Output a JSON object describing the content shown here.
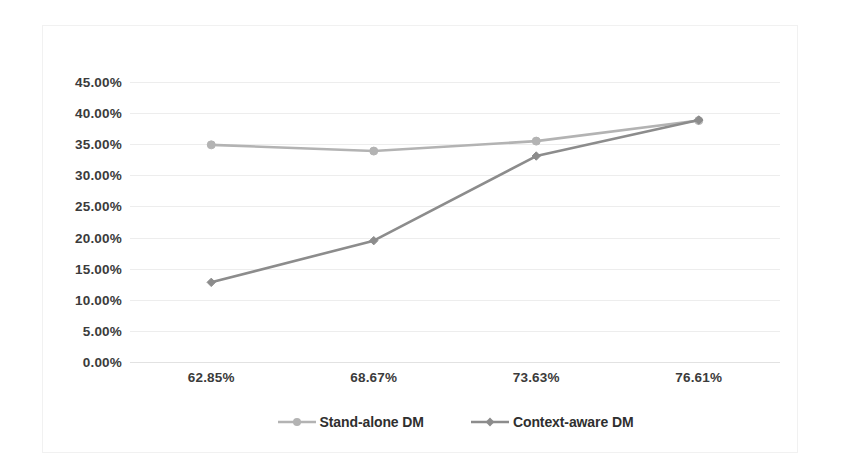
{
  "chart_data": {
    "type": "line",
    "title": "",
    "subtitle": "",
    "xlabel": "",
    "ylabel": "",
    "categories": [
      "62.85%",
      "68.67%",
      "73.63%",
      "76.61%"
    ],
    "series": [
      {
        "name": "Stand-alone DM",
        "color": "#b3b3b3",
        "marker": "circle",
        "values": [
          34.9,
          33.9,
          35.5,
          38.8
        ]
      },
      {
        "name": "Context-aware DM",
        "color": "#8c8c8c",
        "marker": "diamond",
        "values": [
          12.8,
          19.5,
          33.1,
          38.9
        ]
      }
    ],
    "ylim": [
      0,
      45
    ],
    "ytick_step": 5,
    "ytick_labels": [
      "45.00%",
      "40.00%",
      "35.00%",
      "30.00%",
      "25.00%",
      "20.00%",
      "15.00%",
      "10.00%",
      "5.00%",
      "0.00%"
    ],
    "ytick_values": [
      45,
      40,
      35,
      30,
      25,
      20,
      15,
      10,
      5,
      0
    ],
    "grid": true,
    "grid_axis": "y",
    "legend_position": "bottom",
    "legend_entries": [
      "Stand-alone DM",
      "Context-aware DM"
    ],
    "annotations": [],
    "colors": {
      "grid": "#ededed",
      "axis": "#e2e2e2",
      "frame": "#f1f1f1",
      "text": "#3b3b3b",
      "background": "#ffffff"
    }
  }
}
